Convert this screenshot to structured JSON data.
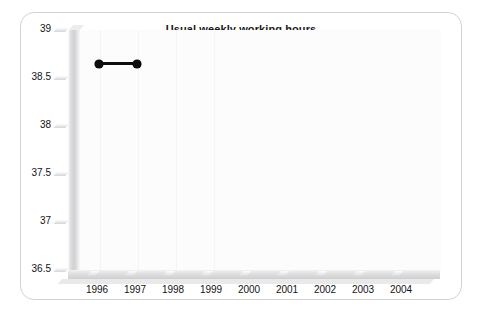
{
  "chart_data": {
    "type": "line",
    "title": "Usual weekly working hours",
    "xlabel": "",
    "ylabel": "",
    "categories": [
      "1996",
      "1997",
      "1998",
      "1999",
      "2000",
      "2001",
      "2002",
      "2003",
      "2004"
    ],
    "x": [
      1996,
      1997,
      1998,
      1999,
      2000,
      2001,
      2002,
      2003,
      2004
    ],
    "xlim": [
      1996,
      2004
    ],
    "ylim": [
      36.5,
      39
    ],
    "yticks": [
      "36.5",
      "37",
      "37.5",
      "38",
      "38.5",
      "39"
    ],
    "ytick_values": [
      36.5,
      37,
      37.5,
      38,
      38.5,
      39
    ],
    "grid": false,
    "legend": null,
    "series": [
      {
        "name": "Usual weekly working hours",
        "color": "#0d0d0d",
        "marker": "circle",
        "values": [
          38.65,
          38.65,
          null,
          null,
          null,
          null,
          null,
          null,
          null
        ]
      }
    ]
  },
  "frame": {
    "border_color": "#d3d3d5",
    "background": "#ffffff"
  },
  "axis": {
    "slab_color": "#d0d0d2",
    "tick_color": "#131313"
  },
  "artifacts": {
    "top_bleed": "scan bleed-through",
    "a": "scan bleed-through",
    "b": "scan bleed-through",
    "c": "scan bleed-through",
    "d": "scan bleed-through",
    "e": "scan bleed-through",
    "f": "scan bleed-through"
  }
}
